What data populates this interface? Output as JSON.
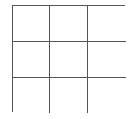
{
  "game": {
    "type": "tic-tac-toe",
    "rows": 3,
    "cols": 3,
    "line_color": "#555555",
    "cells": [
      [
        "",
        "",
        ""
      ],
      [
        "",
        "",
        ""
      ],
      [
        "",
        "",
        ""
      ]
    ]
  }
}
